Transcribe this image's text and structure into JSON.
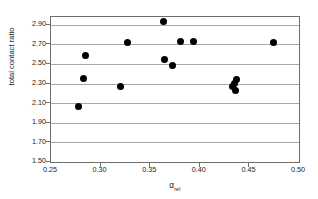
{
  "chart_data": {
    "type": "scatter",
    "title": "",
    "xlabel": "α",
    "xlabel_subscript": "rel",
    "ylabel": "total contact ratio",
    "xlim": [
      0.25,
      0.5
    ],
    "ylim": [
      1.5,
      2.98
    ],
    "xticks": [
      0.25,
      0.3,
      0.35,
      0.4,
      0.45,
      0.5
    ],
    "xtick_labels": [
      "0.25",
      "0.30",
      "0.35",
      "0.40",
      "0.45",
      "0.50"
    ],
    "yticks": [
      1.5,
      1.7,
      1.9,
      2.1,
      2.3,
      2.5,
      2.7,
      2.9
    ],
    "ytick_labels": [
      "1.50",
      "1.70",
      "1.90",
      "2.10",
      "2.30",
      "2.50",
      "2.70",
      "2.90"
    ],
    "grid": "horizontal",
    "legend": "none",
    "marker": "filled-circle",
    "marker_color": "#000000",
    "points": [
      {
        "x": 0.2775,
        "y": 2.065
      },
      {
        "x": 0.2825,
        "y": 2.35
      },
      {
        "x": 0.2845,
        "y": 2.585
      },
      {
        "x": 0.32,
        "y": 2.275
      },
      {
        "x": 0.327,
        "y": 2.72
      },
      {
        "x": 0.3635,
        "y": 2.935
      },
      {
        "x": 0.364,
        "y": 2.55
      },
      {
        "x": 0.372,
        "y": 2.49
      },
      {
        "x": 0.3805,
        "y": 2.73
      },
      {
        "x": 0.394,
        "y": 2.725
      },
      {
        "x": 0.433,
        "y": 2.27
      },
      {
        "x": 0.435,
        "y": 2.3
      },
      {
        "x": 0.4355,
        "y": 2.225
      },
      {
        "x": 0.4365,
        "y": 2.34
      },
      {
        "x": 0.474,
        "y": 2.72
      }
    ]
  }
}
